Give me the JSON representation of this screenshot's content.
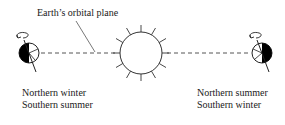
{
  "diagram": {
    "orbital_plane_label": "Earth’s orbital plane",
    "left_earth": {
      "caption_line1": "Northern winter",
      "caption_line2": "Southern summer"
    },
    "right_earth": {
      "caption_line1": "Northern summer",
      "caption_line2": "Southern winter"
    },
    "colors": {
      "stroke": "#333333",
      "dark_half": "#000000",
      "background": "#ffffff"
    }
  }
}
